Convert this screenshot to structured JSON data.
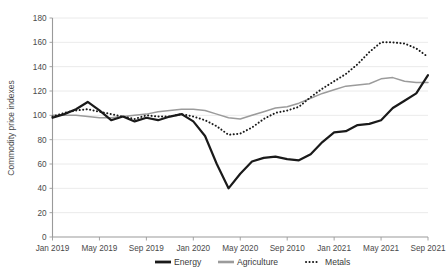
{
  "chart_data": {
    "type": "line",
    "title": "",
    "xlabel": "",
    "ylabel": "Commodity price indexes",
    "ylim": [
      0,
      180
    ],
    "ytick_step": 20,
    "grid": true,
    "legend_position": "bottom",
    "yticks": [
      "0",
      "20",
      "40",
      "60",
      "80",
      "100",
      "120",
      "140",
      "160",
      "180"
    ],
    "xticks": [
      "Jan 2019",
      "May 2019",
      "Sep 2019",
      "Jan 2020",
      "May 2020",
      "Sep 2010",
      "Jan 2021",
      "May 2021",
      "Sep 2021"
    ],
    "x": [
      "Jan 2019",
      "Feb 2019",
      "Mar 2019",
      "Apr 2019",
      "May 2019",
      "Jun 2019",
      "Jul 2019",
      "Aug 2019",
      "Sep 2019",
      "Oct 2019",
      "Nov 2019",
      "Dec 2019",
      "Jan 2020",
      "Feb 2020",
      "Mar 2020",
      "Apr 2020",
      "May 2020",
      "Jun 2020",
      "Jul 2020",
      "Aug 2020",
      "Sep 2020",
      "Oct 2020",
      "Nov 2020",
      "Dec 2020",
      "Jan 2021",
      "Feb 2021",
      "Mar 2021",
      "Apr 2021",
      "May 2021",
      "Jun 2021",
      "Jul 2021",
      "Aug 2021",
      "Sep 2021"
    ],
    "series": [
      {
        "name": "Energy",
        "style": "solid-thick-black",
        "color": "#1a1a1a",
        "values": [
          98,
          101,
          105,
          111,
          104,
          96,
          99,
          95,
          98,
          96,
          99,
          101,
          95,
          83,
          60,
          40,
          52,
          62,
          65,
          66,
          64,
          63,
          68,
          78,
          86,
          87,
          92,
          93,
          96,
          106,
          112,
          118,
          133
        ]
      },
      {
        "name": "Agriculture",
        "style": "solid-gray",
        "color": "#9b9b9b",
        "values": [
          100,
          100,
          100,
          99,
          98,
          98,
          99,
          100,
          101,
          103,
          104,
          105,
          105,
          104,
          101,
          98,
          97,
          100,
          103,
          106,
          107,
          110,
          114,
          118,
          121,
          124,
          125,
          126,
          130,
          131,
          128,
          127,
          127
        ]
      },
      {
        "name": "Metals",
        "style": "dotted-black",
        "color": "#1a1a1a",
        "values": [
          99,
          102,
          104,
          105,
          103,
          101,
          99,
          97,
          100,
          99,
          99,
          101,
          99,
          96,
          91,
          84,
          85,
          90,
          97,
          102,
          104,
          107,
          115,
          122,
          128,
          134,
          142,
          152,
          160,
          160,
          159,
          155,
          148
        ]
      }
    ],
    "legend": [
      {
        "label": "Energy",
        "marker": "solid-thick"
      },
      {
        "label": "Agriculture",
        "marker": "solid-gray"
      },
      {
        "label": "Metals",
        "marker": "dotted"
      }
    ]
  }
}
